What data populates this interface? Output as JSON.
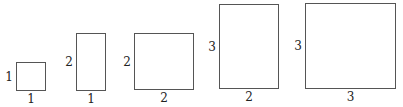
{
  "figure": {
    "rectangles": [
      {
        "width_label": "1",
        "height_label": "1",
        "x": 16,
        "y": 62,
        "w": 30,
        "h": 29
      },
      {
        "width_label": "1",
        "height_label": "2",
        "x": 76,
        "y": 33,
        "w": 30,
        "h": 58
      },
      {
        "width_label": "2",
        "height_label": "2",
        "x": 134,
        "y": 33,
        "w": 60,
        "h": 57
      },
      {
        "width_label": "2",
        "height_label": "3",
        "x": 219,
        "y": 4,
        "w": 60,
        "h": 85
      },
      {
        "width_label": "3",
        "height_label": "3",
        "x": 305,
        "y": 3,
        "w": 91,
        "h": 86
      }
    ]
  }
}
